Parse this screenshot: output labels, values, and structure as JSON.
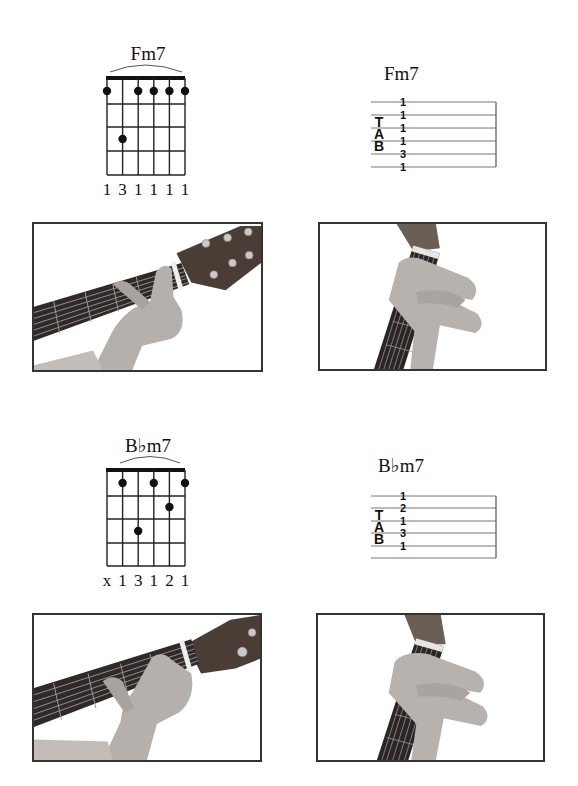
{
  "page": {
    "sections": [
      {
        "chord_name": "Fm7",
        "diagram": {
          "title": "Fm7",
          "strings": 6,
          "frets_shown": 4,
          "barre_arc": true,
          "dots": [
            {
              "string": 1,
              "fret": 1
            },
            {
              "string": 2,
              "fret": 3
            },
            {
              "string": 3,
              "fret": 1
            },
            {
              "string": 4,
              "fret": 1
            },
            {
              "string": 5,
              "fret": 1
            },
            {
              "string": 6,
              "fret": 1
            }
          ],
          "fingering": [
            "1",
            "3",
            "1",
            "1",
            "1",
            "1"
          ]
        },
        "tab": {
          "title": "Fm7",
          "clef": [
            "T",
            "A",
            "B"
          ],
          "numbers": [
            "1",
            "1",
            "1",
            "1",
            "3",
            "1"
          ]
        },
        "photos": [
          {
            "label": "Fm7 chord shape, front view of hand on fretboard"
          },
          {
            "label": "Fm7 chord shape, player's-eye view"
          }
        ]
      },
      {
        "chord_name": "B♭m7",
        "diagram": {
          "title": "B♭m7",
          "strings": 6,
          "frets_shown": 4,
          "barre_arc": true,
          "dots": [
            {
              "string": 2,
              "fret": 1
            },
            {
              "string": 3,
              "fret": 3
            },
            {
              "string": 4,
              "fret": 1
            },
            {
              "string": 5,
              "fret": 2
            },
            {
              "string": 6,
              "fret": 1
            }
          ],
          "fingering": [
            "x",
            "1",
            "3",
            "1",
            "2",
            "1"
          ]
        },
        "tab": {
          "title": "B♭m7",
          "clef": [
            "T",
            "A",
            "B"
          ],
          "numbers": [
            "1",
            "2",
            "1",
            "3",
            "1",
            ""
          ]
        },
        "photos": [
          {
            "label": "B♭m7 chord shape, front view of hand on fretboard"
          },
          {
            "label": "B♭m7 chord shape, player's-eye view"
          }
        ]
      }
    ]
  }
}
